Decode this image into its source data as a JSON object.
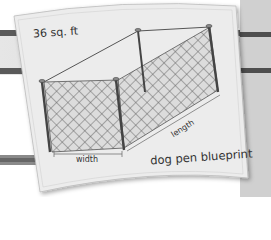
{
  "illustration": {
    "subject": "dog pen blueprint",
    "area_label": "36 sq. ft",
    "width_label": "width",
    "length_label": "length",
    "title_label": "dog pen blueprint"
  },
  "colors": {
    "background": "#ffffff",
    "rail": "#555555",
    "paper": "#ececec",
    "ink": "#333333"
  }
}
